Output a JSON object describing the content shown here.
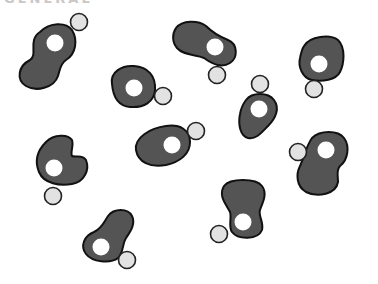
{
  "header": {
    "text_fragment": "GENERAL"
  },
  "colors": {
    "molecule_fill": "#545454",
    "molecule_outline": "#111111",
    "inner_charge_fill": "#ffffff",
    "outer_charge_fill": "#e2e2e2",
    "background": "#ffffff"
  },
  "molecules": [
    {
      "id": 1,
      "inner_charge": "+",
      "outer_charge": "−",
      "inner_pos": [
        55,
        43
      ],
      "outer_pos": [
        79,
        22
      ]
    },
    {
      "id": 2,
      "inner_charge": "+",
      "outer_charge": "−",
      "inner_pos": [
        134,
        88
      ],
      "outer_pos": [
        163,
        96
      ]
    },
    {
      "id": 3,
      "inner_charge": "−",
      "outer_charge": "+",
      "inner_pos": [
        215,
        47
      ],
      "outer_pos": [
        217,
        75
      ]
    },
    {
      "id": 4,
      "inner_charge": "−",
      "outer_charge": "+",
      "inner_pos": [
        259,
        109
      ],
      "outer_pos": [
        260,
        84
      ]
    },
    {
      "id": 5,
      "inner_charge": "+",
      "outer_charge": "−",
      "inner_pos": [
        319,
        64
      ],
      "outer_pos": [
        314,
        89
      ]
    },
    {
      "id": 6,
      "inner_charge": "+",
      "outer_charge": "−",
      "inner_pos": [
        172,
        145
      ],
      "outer_pos": [
        196,
        131
      ]
    },
    {
      "id": 7,
      "inner_charge": "−",
      "outer_charge": "+",
      "inner_pos": [
        54,
        168
      ],
      "outer_pos": [
        53,
        196
      ]
    },
    {
      "id": 8,
      "inner_charge": "−",
      "outer_charge": "+",
      "inner_pos": [
        326,
        150
      ],
      "outer_pos": [
        298,
        152
      ]
    },
    {
      "id": 9,
      "inner_charge": "+",
      "outer_charge": "−",
      "inner_pos": [
        243,
        222
      ],
      "outer_pos": [
        219,
        234
      ]
    },
    {
      "id": 10,
      "inner_charge": "−",
      "outer_charge": "+",
      "inner_pos": [
        101,
        247
      ],
      "outer_pos": [
        127,
        260
      ]
    }
  ]
}
